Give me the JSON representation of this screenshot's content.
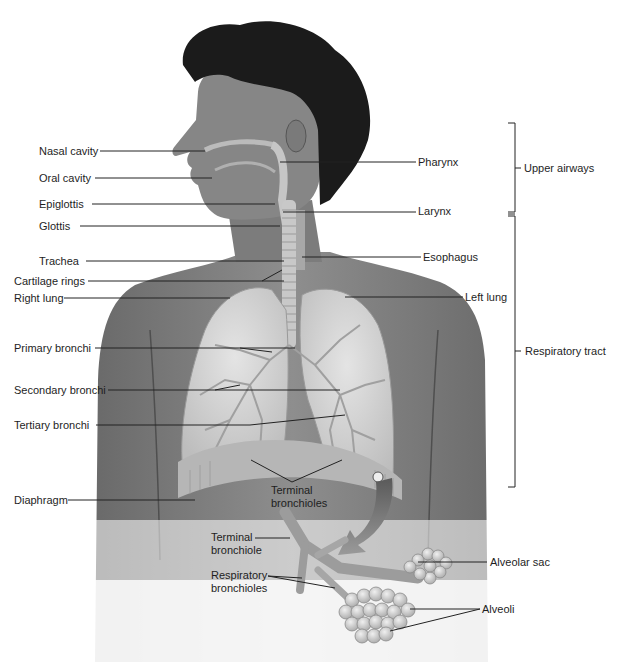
{
  "diagram": {
    "labels_left": [
      {
        "id": "nasal-cavity",
        "text": "Nasal cavity",
        "x": 39,
        "y": 145
      },
      {
        "id": "oral-cavity",
        "text": "Oral cavity",
        "x": 39,
        "y": 172
      },
      {
        "id": "epiglottis",
        "text": "Epiglottis",
        "x": 39,
        "y": 198
      },
      {
        "id": "glottis",
        "text": "Glottis",
        "x": 39,
        "y": 220
      },
      {
        "id": "trachea",
        "text": "Trachea",
        "x": 39,
        "y": 255
      },
      {
        "id": "cartilage-rings",
        "text": "Cartilage rings",
        "x": 14,
        "y": 276
      },
      {
        "id": "right-lung",
        "text": "Right lung",
        "x": 14,
        "y": 292
      },
      {
        "id": "primary-bronchi",
        "text": "Primary bronchi",
        "x": 14,
        "y": 343
      },
      {
        "id": "secondary-bronchi",
        "text": "Secondary bronchi",
        "x": 14,
        "y": 384
      },
      {
        "id": "tertiary-bronchi",
        "text": "Tertiary bronchi",
        "x": 14,
        "y": 419
      },
      {
        "id": "diaphragm",
        "text": "Diaphragm",
        "x": 14,
        "y": 494
      }
    ],
    "labels_right": [
      {
        "id": "pharynx",
        "text": "Pharynx",
        "x": 418,
        "y": 155
      },
      {
        "id": "larynx",
        "text": "Larynx",
        "x": 418,
        "y": 205
      },
      {
        "id": "esophagus",
        "text": "Esophagus",
        "x": 423,
        "y": 251
      },
      {
        "id": "left-lung",
        "text": "Left lung",
        "x": 465,
        "y": 290
      }
    ],
    "labels_center": {
      "terminal_bronchioles": {
        "line1": "Terminal",
        "line2": "bronchioles"
      },
      "terminal_bronchiole": {
        "line1": "Terminal",
        "line2": "bronchiole"
      },
      "respiratory_bronchioles": {
        "line1": "Respiratory",
        "line2": "bronchioles"
      },
      "alveolar_sac": "Alveolar sac",
      "alveoli": "Alveoli"
    },
    "brackets": {
      "upper_airways": "Upper airways",
      "respiratory_tract": "Respiratory tract"
    },
    "colors": {
      "skin": "#8a8a8a",
      "skin_dark": "#5e5e5e",
      "hair": "#1b1b1b",
      "lung": "#d4d4d4",
      "airway": "#c8c8c8",
      "leader_line": "#222222"
    }
  }
}
